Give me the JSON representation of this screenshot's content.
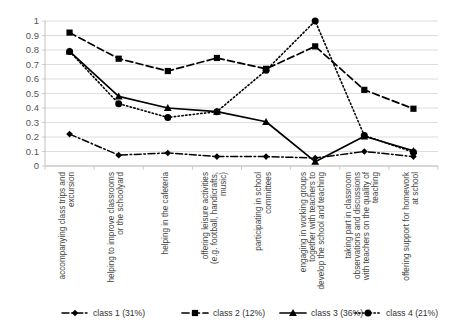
{
  "chart_data": {
    "type": "line",
    "title": "",
    "subtitle": "",
    "xlabel": "",
    "ylabel": "",
    "ylim": [
      0,
      1
    ],
    "y_ticks": [
      "0",
      "0.1",
      "0.2",
      "0.3",
      "0.4",
      "0.5",
      "0.6",
      "0.7",
      "0.8",
      "0.9",
      "1"
    ],
    "y_tick_values": [
      0,
      0.1,
      0.2,
      0.3,
      0.4,
      0.5,
      0.6,
      0.7,
      0.8,
      0.9,
      1
    ],
    "grid": "horizontal",
    "legend_position": "bottom",
    "categories": [
      "accompanying class trips and excursion",
      "helping to improve classrooms or the schoolyard",
      "helping in the cafeteria",
      "offering leisure activities (e.g. football, handicrafts, music)",
      "participating in school committees",
      "engaging in working groups together with teachers to develop the school and teaching",
      "taking part in classroom observations and discussions with teachers on the quality of teaching",
      "offering support for homework at school"
    ],
    "series": [
      {
        "name": "class 1 (31%)",
        "marker": "diamond",
        "line_style": "dashdot",
        "values": [
          0.22,
          0.075,
          0.09,
          0.065,
          0.065,
          0.055,
          0.1,
          0.065
        ]
      },
      {
        "name": "class 2 (12%)",
        "marker": "square",
        "line_style": "dashed",
        "values": [
          0.92,
          0.74,
          0.655,
          0.745,
          0.67,
          0.825,
          0.525,
          0.395
        ]
      },
      {
        "name": "class 3 (36%)",
        "marker": "triangle",
        "line_style": "solid",
        "values": [
          0.79,
          0.48,
          0.4,
          0.375,
          0.305,
          0.03,
          0.205,
          0.105
        ]
      },
      {
        "name": "class 4 (21%)",
        "marker": "circle",
        "line_style": "dotted",
        "values": [
          0.79,
          0.43,
          0.335,
          0.375,
          0.66,
          1.0,
          0.21,
          0.095
        ]
      }
    ]
  },
  "legend": {
    "items": [
      {
        "label": "class 1 (31%)"
      },
      {
        "label": "class 2 (12%)"
      },
      {
        "label": "class 3 (36%)"
      },
      {
        "label": "class 4 (21%)"
      }
    ]
  },
  "colors": {
    "series": "#000000",
    "grid": "#d4d4d4",
    "axis": "#b9b9b9",
    "text": "#3a3a3a",
    "background": "#ffffff"
  }
}
